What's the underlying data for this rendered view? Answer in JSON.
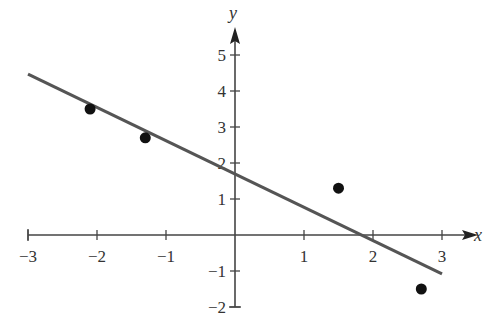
{
  "chart_data": {
    "type": "scatter",
    "title": "",
    "xlabel": "x",
    "ylabel": "y",
    "xlim": [
      -3,
      3
    ],
    "ylim": [
      -2,
      5
    ],
    "grid": false,
    "legend": null,
    "x_ticks": [
      -3,
      -2,
      -1,
      1,
      2,
      3
    ],
    "x_tick_labels": [
      "−3",
      "−2",
      "−1",
      "1",
      "2",
      "3"
    ],
    "y_ticks": [
      -2,
      -1,
      1,
      2,
      3,
      4,
      5
    ],
    "y_tick_labels": [
      "−2",
      "−1",
      "1",
      "2",
      "3",
      "4",
      "5"
    ],
    "series": [
      {
        "name": "data points",
        "type": "scatter",
        "points": [
          {
            "x": -2.1,
            "y": 3.5
          },
          {
            "x": -1.3,
            "y": 2.7
          },
          {
            "x": 1.5,
            "y": 1.3
          },
          {
            "x": 2.7,
            "y": -1.5
          }
        ],
        "color": "#111111"
      },
      {
        "name": "regression line",
        "type": "line",
        "points": [
          {
            "x": -3,
            "y": 4.47
          },
          {
            "x": 3,
            "y": -1.08
          }
        ],
        "slope": -0.925,
        "intercept": 1.69,
        "color": "#555555"
      }
    ]
  },
  "colors": {
    "axis": "#444444",
    "line": "#555555",
    "points": "#111111",
    "text": "#333333"
  }
}
